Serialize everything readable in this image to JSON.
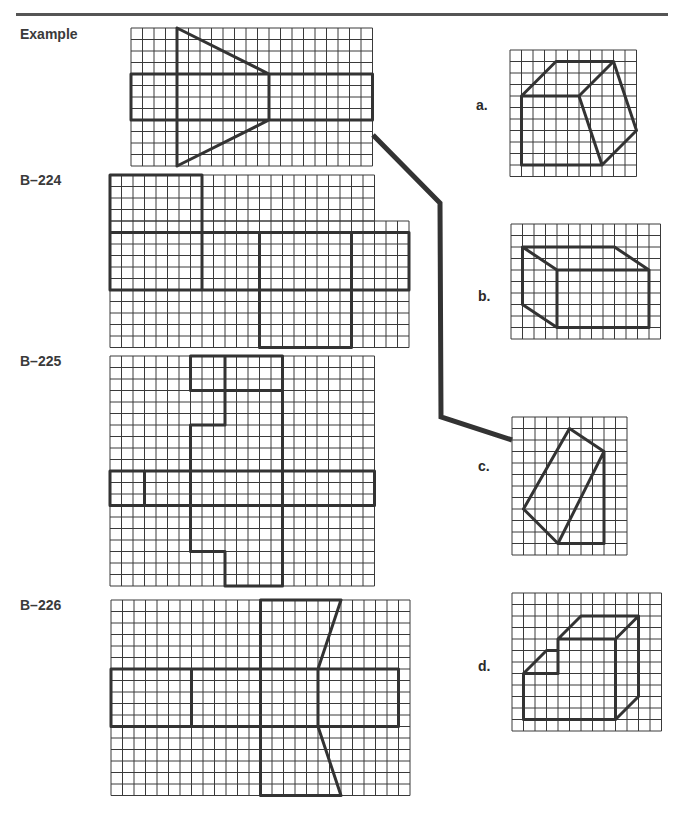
{
  "page": {
    "header_rule": true,
    "cell_size": 11.5,
    "grid_color": "#3a3a3a",
    "shape_color": "#333333",
    "connector_color": "#333333"
  },
  "labels": {
    "example": "Example",
    "b224": "B–224",
    "b225": "B–225",
    "b226": "B–226",
    "a": "a.",
    "b": "b.",
    "c": "c.",
    "d": "d."
  },
  "problems": [
    {
      "id": "example",
      "label": "Example",
      "grids": [
        {
          "x": 131,
          "y": 28,
          "cols": 21,
          "rows": 12
        }
      ],
      "origin": {
        "x": 131,
        "y": 28
      },
      "segments": [
        [
          4,
          0,
          4,
          12
        ],
        [
          4,
          0,
          12,
          4
        ],
        [
          4,
          12,
          12,
          8
        ],
        [
          12,
          4,
          12,
          8
        ],
        [
          0,
          4,
          21,
          4
        ],
        [
          0,
          8,
          21,
          8
        ],
        [
          0,
          4,
          0,
          8
        ],
        [
          21,
          4,
          21,
          8
        ]
      ]
    },
    {
      "id": "b224",
      "label": "B–224",
      "grids": [
        {
          "x": 110,
          "y": 175,
          "cols": 23,
          "rows": 4
        },
        {
          "x": 110,
          "y": 221,
          "cols": 26,
          "rows": 11
        }
      ],
      "origin": {
        "x": 110,
        "y": 175
      },
      "segments": [
        [
          0,
          0,
          8,
          0
        ],
        [
          0,
          0,
          0,
          10
        ],
        [
          8,
          0,
          8,
          10
        ],
        [
          0,
          5,
          26,
          5
        ],
        [
          0,
          10,
          26,
          10
        ],
        [
          26,
          5,
          26,
          10
        ],
        [
          13,
          5,
          13,
          15
        ],
        [
          21,
          5,
          21,
          15
        ],
        [
          13,
          15,
          21,
          15
        ]
      ]
    },
    {
      "id": "b225",
      "label": "B–225",
      "grids": [
        {
          "x": 110,
          "y": 356,
          "cols": 23,
          "rows": 20
        }
      ],
      "origin": {
        "x": 110,
        "y": 356
      },
      "segments": [
        [
          7,
          0,
          15,
          0
        ],
        [
          7,
          0,
          7,
          3
        ],
        [
          10,
          0,
          10,
          6
        ],
        [
          7,
          3,
          15,
          3
        ],
        [
          10,
          6,
          7,
          6
        ],
        [
          7,
          6,
          7,
          17
        ],
        [
          7,
          17,
          10,
          17
        ],
        [
          10,
          17,
          10,
          20
        ],
        [
          15,
          0,
          15,
          20
        ],
        [
          10,
          20,
          15,
          20
        ],
        [
          0,
          10,
          23,
          10
        ],
        [
          0,
          13,
          23,
          13
        ],
        [
          0,
          10,
          0,
          13
        ],
        [
          23,
          10,
          23,
          13
        ],
        [
          3,
          10,
          3,
          13
        ]
      ]
    },
    {
      "id": "b226",
      "label": "B–226",
      "grids": [
        {
          "x": 111,
          "y": 600,
          "cols": 26,
          "rows": 17
        }
      ],
      "origin": {
        "x": 111,
        "y": 600
      },
      "segments": [
        [
          13,
          0,
          13,
          17
        ],
        [
          13,
          0,
          20,
          0
        ],
        [
          20,
          0,
          18,
          6
        ],
        [
          0,
          6,
          25,
          6
        ],
        [
          0,
          11,
          25,
          11
        ],
        [
          0,
          6,
          0,
          11
        ],
        [
          25,
          6,
          25,
          11
        ],
        [
          7,
          6,
          7,
          11
        ],
        [
          18,
          6,
          18,
          11
        ],
        [
          18,
          11,
          20,
          17
        ],
        [
          20,
          17,
          13,
          17
        ]
      ]
    }
  ],
  "options": [
    {
      "id": "a",
      "label": "a.",
      "label_pos": {
        "x": 476,
        "y": 97
      },
      "grid": {
        "x": 510,
        "y": 50,
        "cols": 11,
        "rows": 11
      },
      "segments": [
        [
          1,
          4,
          4,
          1
        ],
        [
          4,
          1,
          9,
          1
        ],
        [
          9,
          1,
          6,
          4
        ],
        [
          1,
          4,
          6,
          4
        ],
        [
          1,
          4,
          1,
          10
        ],
        [
          1,
          10,
          8,
          10
        ],
        [
          6,
          4,
          8,
          10
        ],
        [
          9,
          1,
          11,
          7
        ],
        [
          11,
          7,
          8,
          10
        ]
      ]
    },
    {
      "id": "b",
      "label": "b.",
      "label_pos": {
        "x": 478,
        "y": 288
      },
      "grid": {
        "x": 511,
        "y": 224,
        "cols": 13,
        "rows": 10
      },
      "segments": [
        [
          1,
          2,
          9,
          2
        ],
        [
          9,
          2,
          12,
          4
        ],
        [
          1,
          2,
          4,
          4
        ],
        [
          4,
          4,
          12,
          4
        ],
        [
          4,
          4,
          4,
          9
        ],
        [
          12,
          4,
          12,
          9
        ],
        [
          4,
          9,
          12,
          9
        ],
        [
          1,
          2,
          1,
          7
        ],
        [
          1,
          7,
          4,
          9
        ]
      ]
    },
    {
      "id": "c",
      "label": "c.",
      "label_pos": {
        "x": 478,
        "y": 458
      },
      "grid": {
        "x": 512,
        "y": 417,
        "cols": 10,
        "rows": 12
      },
      "segments": [
        [
          5,
          1,
          8,
          3
        ],
        [
          5,
          1,
          1,
          8
        ],
        [
          1,
          8,
          4,
          11
        ],
        [
          4,
          11,
          8,
          3
        ],
        [
          8,
          3,
          8,
          11
        ],
        [
          4,
          11,
          8,
          11
        ]
      ]
    },
    {
      "id": "d",
      "label": "d.",
      "label_pos": {
        "x": 478,
        "y": 658
      },
      "grid": {
        "x": 512,
        "y": 593,
        "cols": 13,
        "rows": 12
      },
      "segments": [
        [
          1,
          7,
          3,
          5
        ],
        [
          3,
          5,
          4,
          5
        ],
        [
          4,
          4,
          4,
          7
        ],
        [
          1,
          7,
          4,
          7
        ],
        [
          4,
          4,
          6,
          2
        ],
        [
          6,
          2,
          11,
          2
        ],
        [
          4,
          4,
          9,
          4
        ],
        [
          9,
          4,
          11,
          2
        ],
        [
          11,
          2,
          11,
          9
        ],
        [
          9,
          4,
          9,
          11
        ],
        [
          1,
          7,
          1,
          11
        ],
        [
          1,
          11,
          9,
          11
        ],
        [
          9,
          11,
          11,
          9
        ]
      ]
    }
  ],
  "connector": {
    "from": "example",
    "to": "c",
    "points": [
      [
        373,
        135
      ],
      [
        440,
        203
      ],
      [
        441,
        417
      ],
      [
        512,
        440
      ]
    ]
  }
}
